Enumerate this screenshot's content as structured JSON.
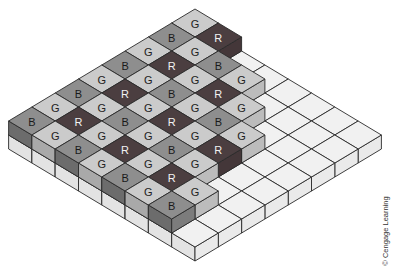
{
  "figure": {
    "credit": "© Cengage Learning",
    "grid": {
      "rows_a": 8,
      "cols_b": 8
    },
    "colors": {
      "G": {
        "top": "#cbcbcb",
        "left": "#a9a9a9",
        "right": "#bcbcbc",
        "text": "#222222"
      },
      "B": {
        "top": "#8e8e8e",
        "left": "#6c6c6c",
        "right": "#7c7c7c",
        "text": "#1a1a1a"
      },
      "R": {
        "top": "#4b3e40",
        "left": "#3a2f31",
        "right": "#443739",
        "text": "#f2f2f2"
      },
      "base": {
        "top": "#f1f1f1",
        "left": "#e3e3e3",
        "right": "#eaeaea"
      },
      "stroke": "#2a2a2a"
    },
    "top_layer": [
      [
        "G",
        "R"
      ],
      [
        "B",
        "G",
        "B",
        "G"
      ],
      [
        "G",
        "R",
        "G",
        "R",
        "G"
      ],
      [
        "B",
        "G",
        "B",
        "G",
        "B",
        "G"
      ],
      [
        "G",
        "R",
        "G",
        "R",
        "G",
        "R"
      ],
      [
        "B",
        "G",
        "B",
        "G",
        "B",
        "G"
      ],
      [
        "G",
        "R",
        "G",
        "R",
        "G",
        "R",
        "G"
      ],
      [
        "B",
        "G",
        "B",
        "G",
        "B",
        "G",
        "B"
      ]
    ]
  }
}
